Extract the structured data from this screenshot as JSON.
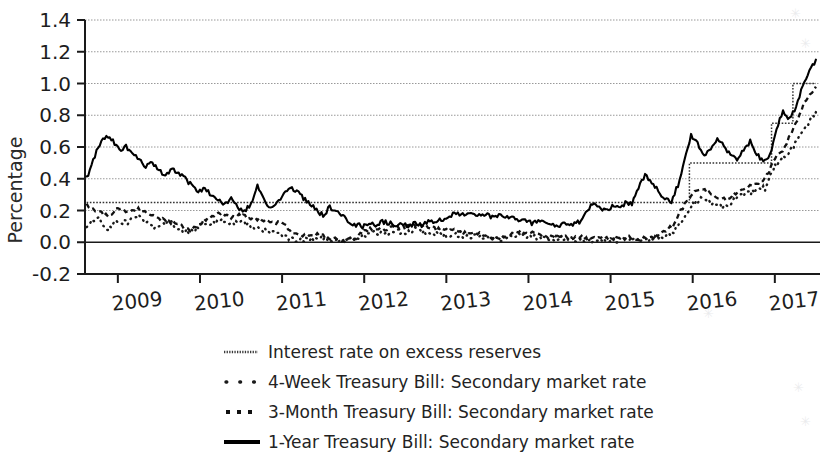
{
  "chart_data": {
    "type": "line",
    "title": "",
    "xlabel": "",
    "ylabel": "Percentage",
    "ylim": [
      -0.2,
      1.4
    ],
    "yticks": [
      -0.2,
      0.0,
      0.2,
      0.4,
      0.6,
      0.8,
      1.0,
      1.2,
      1.4
    ],
    "ytick_labels": [
      "-0.2",
      "0.0",
      "0.2",
      "0.4",
      "0.6",
      "0.8",
      "1.0",
      "1.2",
      "1.4"
    ],
    "xlim": [
      2008.6,
      2017.55
    ],
    "xticks": [
      2009,
      2010,
      2011,
      2012,
      2013,
      2014,
      2015,
      2016,
      2017
    ],
    "xtick_labels": [
      "2009",
      "2010",
      "2011",
      "2012",
      "2013",
      "2014",
      "2015",
      "2016",
      "2017"
    ],
    "grid": "horizontal-light",
    "legend_position": "below-axes",
    "series": [
      {
        "name": "Interest rate on excess reserves",
        "style": "thin-dotted-step",
        "color": "#333333",
        "x": [
          2008.62,
          2015.95,
          2015.96,
          2016.95,
          2016.96,
          2017.21,
          2017.22,
          2017.5
        ],
        "values": [
          0.25,
          0.25,
          0.5,
          0.5,
          0.75,
          0.75,
          1.0,
          1.0
        ]
      },
      {
        "name": "4-Week Treasury Bill: Secondary market rate",
        "style": "dotted",
        "color": "#1a1a1a",
        "x": [
          2008.62,
          2008.75,
          2008.88,
          2009.0,
          2009.12,
          2009.25,
          2009.38,
          2009.5,
          2009.62,
          2009.75,
          2009.88,
          2010.0,
          2010.12,
          2010.25,
          2010.38,
          2010.5,
          2010.62,
          2010.75,
          2010.88,
          2011.0,
          2011.12,
          2011.25,
          2011.38,
          2011.5,
          2011.62,
          2011.75,
          2011.88,
          2012.0,
          2012.12,
          2012.25,
          2012.38,
          2012.5,
          2012.62,
          2012.75,
          2012.88,
          2013.0,
          2013.12,
          2013.25,
          2013.38,
          2013.5,
          2013.62,
          2013.75,
          2013.88,
          2014.0,
          2014.12,
          2014.25,
          2014.38,
          2014.5,
          2014.62,
          2014.75,
          2014.88,
          2015.0,
          2015.12,
          2015.25,
          2015.38,
          2015.5,
          2015.62,
          2015.75,
          2015.88,
          2016.0,
          2016.12,
          2016.25,
          2016.38,
          2016.5,
          2016.62,
          2016.75,
          2016.88,
          2017.0,
          2017.12,
          2017.25,
          2017.38,
          2017.5
        ],
        "values": [
          0.1,
          0.16,
          0.08,
          0.14,
          0.12,
          0.17,
          0.11,
          0.09,
          0.13,
          0.08,
          0.06,
          0.1,
          0.12,
          0.14,
          0.11,
          0.13,
          0.1,
          0.08,
          0.06,
          0.04,
          0.02,
          0.01,
          0.03,
          0.02,
          0.01,
          0.01,
          0.02,
          0.04,
          0.06,
          0.05,
          0.07,
          0.06,
          0.08,
          0.06,
          0.05,
          0.04,
          0.05,
          0.03,
          0.04,
          0.03,
          0.02,
          0.03,
          0.05,
          0.04,
          0.03,
          0.02,
          0.03,
          0.02,
          0.02,
          0.01,
          0.02,
          0.01,
          0.01,
          0.02,
          0.01,
          0.02,
          0.03,
          0.06,
          0.14,
          0.24,
          0.28,
          0.24,
          0.22,
          0.26,
          0.3,
          0.32,
          0.34,
          0.48,
          0.54,
          0.62,
          0.72,
          0.82
        ]
      },
      {
        "name": "3-Month Treasury Bill: Secondary market rate",
        "style": "dash-dot",
        "color": "#111111",
        "x": [
          2008.62,
          2008.75,
          2008.88,
          2009.0,
          2009.12,
          2009.25,
          2009.38,
          2009.5,
          2009.62,
          2009.75,
          2009.88,
          2010.0,
          2010.12,
          2010.25,
          2010.38,
          2010.5,
          2010.62,
          2010.75,
          2010.88,
          2011.0,
          2011.12,
          2011.25,
          2011.38,
          2011.5,
          2011.62,
          2011.75,
          2011.88,
          2012.0,
          2012.12,
          2012.25,
          2012.38,
          2012.5,
          2012.62,
          2012.75,
          2012.88,
          2013.0,
          2013.12,
          2013.25,
          2013.38,
          2013.5,
          2013.62,
          2013.75,
          2013.88,
          2014.0,
          2014.12,
          2014.25,
          2014.38,
          2014.5,
          2014.62,
          2014.75,
          2014.88,
          2015.0,
          2015.12,
          2015.25,
          2015.38,
          2015.5,
          2015.62,
          2015.75,
          2015.88,
          2016.0,
          2016.12,
          2016.25,
          2016.38,
          2016.5,
          2016.62,
          2016.75,
          2016.88,
          2017.0,
          2017.12,
          2017.25,
          2017.38,
          2017.5
        ],
        "values": [
          0.23,
          0.2,
          0.16,
          0.22,
          0.19,
          0.21,
          0.17,
          0.15,
          0.13,
          0.11,
          0.08,
          0.12,
          0.16,
          0.18,
          0.16,
          0.17,
          0.15,
          0.14,
          0.13,
          0.12,
          0.06,
          0.04,
          0.05,
          0.04,
          0.02,
          0.01,
          0.02,
          0.07,
          0.09,
          0.08,
          0.1,
          0.09,
          0.11,
          0.1,
          0.08,
          0.08,
          0.07,
          0.05,
          0.06,
          0.04,
          0.03,
          0.05,
          0.07,
          0.06,
          0.05,
          0.03,
          0.04,
          0.03,
          0.03,
          0.02,
          0.03,
          0.02,
          0.02,
          0.03,
          0.02,
          0.03,
          0.05,
          0.1,
          0.22,
          0.31,
          0.33,
          0.29,
          0.27,
          0.3,
          0.34,
          0.36,
          0.4,
          0.52,
          0.6,
          0.74,
          0.9,
          0.98
        ]
      },
      {
        "name": "1-Year Treasury Bill: Secondary market rate",
        "style": "solid",
        "color": "#000000",
        "x": [
          2008.62,
          2008.7,
          2008.78,
          2008.86,
          2008.94,
          2009.02,
          2009.1,
          2009.18,
          2009.26,
          2009.34,
          2009.42,
          2009.5,
          2009.58,
          2009.66,
          2009.74,
          2009.82,
          2009.9,
          2009.98,
          2010.06,
          2010.14,
          2010.22,
          2010.3,
          2010.38,
          2010.46,
          2010.54,
          2010.62,
          2010.7,
          2010.78,
          2010.86,
          2010.94,
          2011.02,
          2011.1,
          2011.18,
          2011.26,
          2011.34,
          2011.42,
          2011.5,
          2011.58,
          2011.66,
          2011.74,
          2011.82,
          2011.9,
          2011.98,
          2012.06,
          2012.14,
          2012.22,
          2012.3,
          2012.38,
          2012.46,
          2012.54,
          2012.62,
          2012.7,
          2012.78,
          2012.86,
          2012.94,
          2013.02,
          2013.1,
          2013.18,
          2013.26,
          2013.34,
          2013.42,
          2013.5,
          2013.58,
          2013.66,
          2013.74,
          2013.82,
          2013.9,
          2013.98,
          2014.06,
          2014.14,
          2014.22,
          2014.3,
          2014.38,
          2014.46,
          2014.54,
          2014.62,
          2014.7,
          2014.78,
          2014.86,
          2014.94,
          2015.02,
          2015.1,
          2015.18,
          2015.26,
          2015.34,
          2015.42,
          2015.5,
          2015.58,
          2015.66,
          2015.74,
          2015.82,
          2015.9,
          2015.98,
          2016.06,
          2016.14,
          2016.22,
          2016.3,
          2016.38,
          2016.46,
          2016.54,
          2016.62,
          2016.7,
          2016.78,
          2016.86,
          2016.94,
          2017.02,
          2017.1,
          2017.18,
          2017.26,
          2017.34,
          2017.42,
          2017.5
        ],
        "values": [
          0.4,
          0.52,
          0.62,
          0.68,
          0.64,
          0.58,
          0.61,
          0.55,
          0.52,
          0.47,
          0.5,
          0.45,
          0.42,
          0.46,
          0.43,
          0.4,
          0.36,
          0.32,
          0.34,
          0.3,
          0.26,
          0.24,
          0.28,
          0.22,
          0.19,
          0.24,
          0.36,
          0.26,
          0.22,
          0.25,
          0.3,
          0.35,
          0.32,
          0.28,
          0.24,
          0.2,
          0.17,
          0.22,
          0.19,
          0.16,
          0.13,
          0.11,
          0.1,
          0.12,
          0.11,
          0.13,
          0.12,
          0.11,
          0.12,
          0.1,
          0.12,
          0.11,
          0.13,
          0.12,
          0.14,
          0.16,
          0.18,
          0.17,
          0.19,
          0.18,
          0.16,
          0.17,
          0.15,
          0.17,
          0.16,
          0.15,
          0.14,
          0.13,
          0.12,
          0.14,
          0.12,
          0.11,
          0.1,
          0.12,
          0.11,
          0.13,
          0.18,
          0.24,
          0.22,
          0.2,
          0.23,
          0.21,
          0.25,
          0.24,
          0.35,
          0.42,
          0.38,
          0.32,
          0.28,
          0.26,
          0.36,
          0.52,
          0.68,
          0.62,
          0.54,
          0.58,
          0.66,
          0.6,
          0.55,
          0.52,
          0.58,
          0.64,
          0.56,
          0.5,
          0.55,
          0.72,
          0.82,
          0.78,
          0.85,
          1.0,
          1.08,
          1.15
        ]
      }
    ]
  },
  "legend": {
    "items": [
      {
        "label": "Interest rate on excess reserves",
        "marker": "thin-dotted-line-marker"
      },
      {
        "label": "4-Week Treasury Bill: Secondary market rate",
        "marker": "dotted-line-marker"
      },
      {
        "label": "3-Month Treasury Bill: Secondary market rate",
        "marker": "dash-dot-line-marker"
      },
      {
        "label": "1-Year Treasury Bill: Secondary market rate",
        "marker": "solid-line-marker"
      }
    ]
  }
}
